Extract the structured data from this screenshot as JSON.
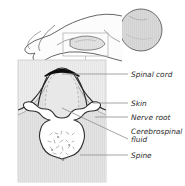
{
  "figure": {
    "panels": {
      "overview": {
        "name": "infant-lateral-position",
        "description": "Infant lying curled on side, lateral decubitus position",
        "callout_box": "lumbar region highlight"
      },
      "detail": {
        "name": "lumbar-cross-section",
        "description": "Magnified transverse cross-section of the lumbar spine"
      }
    }
  },
  "labels": [
    {
      "id": "spinal-cord",
      "text": "Spinal cord",
      "text2": ""
    },
    {
      "id": "skin",
      "text": "Skin",
      "text2": ""
    },
    {
      "id": "nerve-root",
      "text": "Nerve root",
      "text2": ""
    },
    {
      "id": "cerebrospinal-fluid",
      "text": "Cerebrospinal",
      "text2": "fluid"
    },
    {
      "id": "spine",
      "text": "Spine",
      "text2": ""
    }
  ],
  "colors": {
    "outline": "#3a3a3a",
    "leader": "#8a8a8a",
    "panel_fill": "#efefef",
    "tissue_fill": "#e2e2e2",
    "cord_dark": "#101010",
    "body_fill": "#fbfbfb",
    "head_fill": "#d8d8d8",
    "text": "#2b2b2b",
    "background": "#ffffff"
  }
}
